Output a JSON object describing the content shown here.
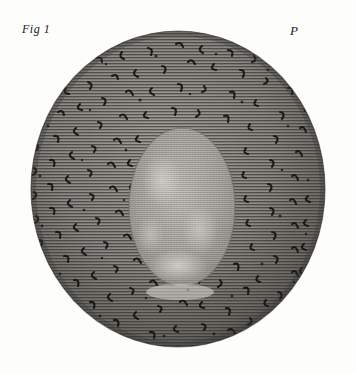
{
  "plate": {
    "background_color": "#fdfdfc",
    "ink_color": "#1b1b1b",
    "width": 356,
    "height": 374
  },
  "labels": {
    "figure": "Fig 1",
    "plate_letter": "P"
  },
  "field": {
    "shape": "circle",
    "center_x": 178,
    "center_y": 189,
    "radius_x": 148,
    "radius_y": 159,
    "description": "circular microscope field of view",
    "hatching": {
      "orientation": "horizontal",
      "line_spacing": 3,
      "line_color": "#2a2a28"
    },
    "annulus_tone": "#8d8a85",
    "rim_tone": "#4a4845"
  },
  "specimen": {
    "shape": "ellipse",
    "center_x": 182,
    "center_y": 207,
    "radius_x": 53,
    "radius_y": 79,
    "description": "lighter finely stippled oval body at centre of field",
    "fill_tone": "#b2afa9",
    "highlight_tone": "#e8e6e1"
  },
  "marks": {
    "description": "scattered dark comma, hook and L-shaped engraved marks across the outer annulus",
    "color": "#141412",
    "count": 214
  }
}
